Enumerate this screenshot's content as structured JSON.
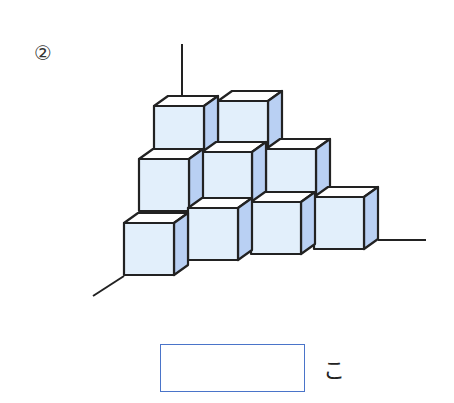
{
  "problem": {
    "number_label": "②",
    "unit_label": "こ",
    "answer_value": ""
  },
  "figure": {
    "colors": {
      "front": "#e2effb",
      "side": "#b9d0f3",
      "top": "#ffffff",
      "edge": "#222222",
      "axis": "#222222",
      "box_border": "#4a74c9"
    },
    "rows_visible": [
      2,
      3,
      4
    ],
    "cube_count_visible": 9
  }
}
